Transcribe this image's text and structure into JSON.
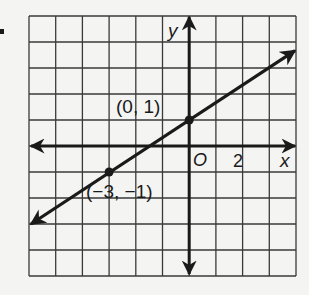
{
  "chart_data": {
    "type": "line",
    "title": "",
    "xlabel": "x",
    "ylabel": "y",
    "xlim": [
      -6,
      4
    ],
    "ylim": [
      -5,
      5
    ],
    "grid": true,
    "grid_step": 1,
    "origin_label": "O",
    "x_tick_labels": [
      {
        "value": 2,
        "label": "2"
      }
    ],
    "line": {
      "slope": 0.6667,
      "intercept": 1,
      "equation": "y = (2/3)x + 1",
      "arrows_both_ends": true
    },
    "points": [
      {
        "x": 0,
        "y": 1,
        "label": "(0, 1)"
      },
      {
        "x": -3,
        "y": -1,
        "label": "(−3, −1)"
      }
    ],
    "colors": {
      "ink": "#1a1a1a",
      "grid": "#3a3a3a",
      "background": "#f4f4f2"
    }
  }
}
